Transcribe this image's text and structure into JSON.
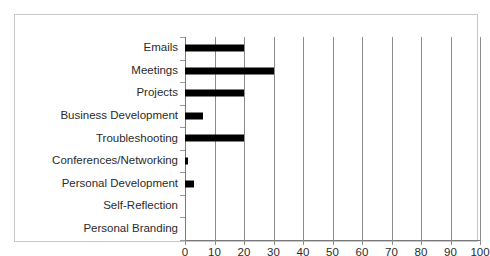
{
  "chart_data": {
    "type": "bar",
    "orientation": "horizontal",
    "title": "",
    "subtitle": "",
    "xlabel": "",
    "ylabel": "",
    "categories": [
      "Emails",
      "Meetings",
      "Projects",
      "Business Development",
      "Troubleshooting",
      "Conferences/Networking",
      "Personal Development",
      "Self-Reflection",
      "Personal Branding"
    ],
    "values": [
      20,
      30,
      20,
      6,
      20,
      1,
      3,
      0,
      0
    ],
    "xlim": [
      0,
      100
    ],
    "xticks": [
      0,
      10,
      20,
      30,
      40,
      50,
      60,
      70,
      80,
      90,
      100
    ],
    "xtick_labels": [
      "0",
      "10",
      "20",
      "30",
      "40",
      "50",
      "60",
      "70",
      "80",
      "90",
      "100"
    ],
    "grid": true,
    "grid_axis": "x",
    "legend": false,
    "legend_position": "none",
    "bar_color": "#000000",
    "grid_color": "#8c8c8c",
    "axis_color": "#7a7a7a",
    "frame_color": "#c8c8c8",
    "background_color": "#ffffff",
    "text_color": "#2b2b2b"
  }
}
